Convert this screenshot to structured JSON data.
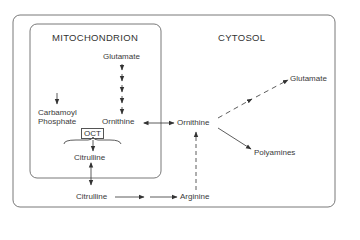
{
  "diagram": {
    "compartments": {
      "mitochondrion": "MITOCHONDRION",
      "cytosol": "CYTOSOL"
    },
    "nodes": {
      "mito_glutamate": "Glutamate",
      "carbamoyl_phosphate_line1": "Carbamoyl",
      "carbamoyl_phosphate_line2": "Phosphate",
      "mito_ornithine": "Ornithine",
      "enzyme_oct": "OCT",
      "mito_citrulline": "Citrulline",
      "cyto_citrulline": "Citrulline",
      "arginine": "Arginine",
      "cyto_ornithine": "Ornithine",
      "cyto_glutamate": "Glutamate",
      "polyamines": "Polyamines"
    },
    "edges": [
      {
        "from": "Glutamate (mito)",
        "to": "Ornithine (mito)",
        "style": "dashed-multistep"
      },
      {
        "from": "Carbamoyl Phosphate",
        "to": "OCT",
        "style": "solid"
      },
      {
        "from": "Ornithine (mito)",
        "to": "Ornithine (cyto)",
        "style": "solid-bidirectional"
      },
      {
        "from": "OCT",
        "to": "Citrulline (mito)",
        "style": "solid"
      },
      {
        "from": "Citrulline (mito)",
        "to": "Citrulline (cyto)",
        "style": "solid-bidirectional"
      },
      {
        "from": "Citrulline (cyto)",
        "to": "Arginine",
        "style": "solid-two-step"
      },
      {
        "from": "Arginine",
        "to": "Ornithine (cyto)",
        "style": "dashed"
      },
      {
        "from": "Ornithine (cyto)",
        "to": "Glutamate (cyto)",
        "style": "dashed-multistep"
      },
      {
        "from": "Ornithine (cyto)",
        "to": "Polyamines",
        "style": "solid"
      }
    ]
  }
}
